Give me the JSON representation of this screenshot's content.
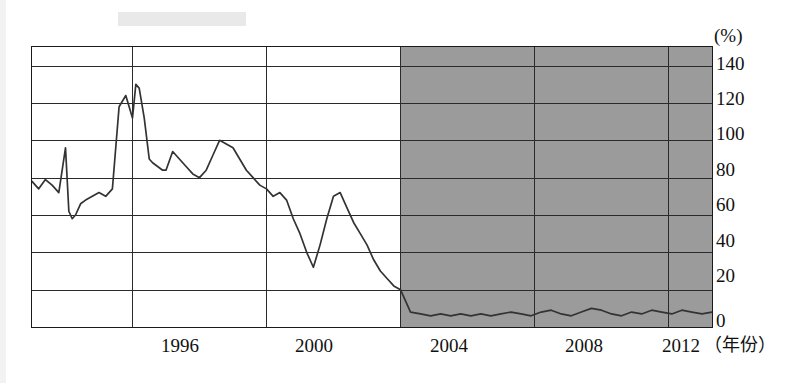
{
  "chart_data": {
    "type": "line",
    "title": "",
    "subtitle": "",
    "xlabel": "（年份）",
    "ylabel": "(%)",
    "unit_label": "(%)",
    "grid": true,
    "legend": null,
    "xlim": [
      1993.0,
      2013.3
    ],
    "ylim": [
      0,
      150
    ],
    "yticks": [
      0,
      20,
      40,
      60,
      80,
      100,
      120,
      140
    ],
    "ytick_labels": [
      "0",
      "20",
      "40",
      "60",
      "80",
      "100",
      "120",
      "140"
    ],
    "xticks": [
      1996,
      2000,
      2004,
      2008,
      2012
    ],
    "xtick_labels": [
      "1996",
      "2000",
      "2004",
      "2008",
      "2012"
    ],
    "shaded_region": {
      "x_start": 2004,
      "x_end": 2013.3,
      "color": "#9b9b9b",
      "label": ""
    },
    "series": [
      {
        "name": "series-1",
        "color": "#333333",
        "x": [
          1993.0,
          1993.2,
          1993.4,
          1993.6,
          1993.8,
          1994.0,
          1994.1,
          1994.2,
          1994.3,
          1994.45,
          1994.6,
          1994.8,
          1995.0,
          1995.2,
          1995.4,
          1995.6,
          1995.8,
          1996.0,
          1996.1,
          1996.2,
          1996.35,
          1996.5,
          1996.6,
          1996.75,
          1996.9,
          1997.0,
          1997.2,
          1997.4,
          1997.6,
          1997.8,
          1998.0,
          1998.2,
          1998.4,
          1998.6,
          1998.8,
          1999.0,
          1999.2,
          1999.4,
          1999.6,
          1999.8,
          2000.0,
          2000.2,
          2000.4,
          2000.6,
          2000.8,
          2001.0,
          2001.2,
          2001.4,
          2001.6,
          2001.8,
          2002.0,
          2002.2,
          2002.4,
          2002.6,
          2002.8,
          2003.0,
          2003.2,
          2003.4,
          2003.6,
          2003.8,
          2004.0,
          2004.3,
          2004.6,
          2004.9,
          2005.2,
          2005.5,
          2005.8,
          2006.1,
          2006.4,
          2006.7,
          2007.0,
          2007.3,
          2007.6,
          2007.9,
          2008.2,
          2008.5,
          2008.8,
          2009.1,
          2009.4,
          2009.7,
          2010.0,
          2010.3,
          2010.6,
          2010.9,
          2011.2,
          2011.5,
          2011.8,
          2012.1,
          2012.4,
          2012.7,
          2013.0,
          2013.3
        ],
        "y": [
          78,
          74,
          79,
          76,
          72,
          96,
          62,
          58,
          60,
          66,
          68,
          70,
          72,
          70,
          74,
          118,
          124,
          112,
          130,
          128,
          112,
          90,
          88,
          86,
          84,
          84,
          94,
          90,
          86,
          82,
          80,
          84,
          92,
          100,
          98,
          96,
          90,
          84,
          80,
          76,
          74,
          70,
          72,
          68,
          58,
          50,
          40,
          32,
          44,
          58,
          70,
          72,
          64,
          56,
          50,
          44,
          36,
          30,
          26,
          22,
          20,
          8,
          7,
          6,
          7,
          6,
          7,
          6,
          7,
          6,
          7,
          8,
          7,
          6,
          8,
          9,
          7,
          6,
          8,
          10,
          9,
          7,
          6,
          8,
          7,
          9,
          8,
          7,
          9,
          8,
          7,
          8
        ]
      }
    ]
  },
  "annotations": {
    "y_axis_unit": "(%)",
    "x_axis_unit": "（年份）"
  }
}
